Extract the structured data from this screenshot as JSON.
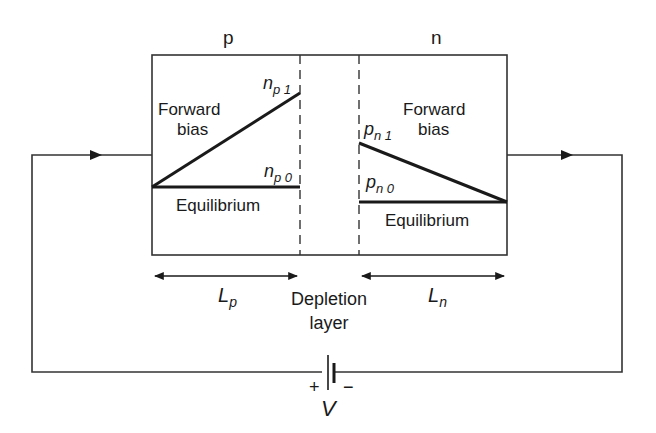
{
  "diagram": {
    "title": "",
    "regions": {
      "p_label": "p",
      "n_label": "n"
    },
    "p_side": {
      "forward_label_line1": "Forward",
      "forward_label_line2": "bias",
      "np1_main": "n",
      "np1_sub": "p 1",
      "np0_main": "n",
      "np0_sub": "p 0",
      "equilibrium_label": "Equilibrium"
    },
    "n_side": {
      "forward_label_line1": "Forward",
      "forward_label_line2": "bias",
      "pn1_main": "p",
      "pn1_sub": "n 1",
      "pn0_main": "p",
      "pn0_sub": "n 0",
      "equilibrium_label": "Equilibrium"
    },
    "lengths": {
      "lp_main": "L",
      "lp_sub": "p",
      "ln_main": "L",
      "ln_sub": "n"
    },
    "depletion": {
      "line1": "Depletion",
      "line2": "layer"
    },
    "battery": {
      "plus": "+",
      "minus": "−",
      "voltage": "V"
    },
    "colors": {
      "stroke": "#1a1a1a",
      "box_stroke": "#333333",
      "background": "#ffffff"
    }
  }
}
